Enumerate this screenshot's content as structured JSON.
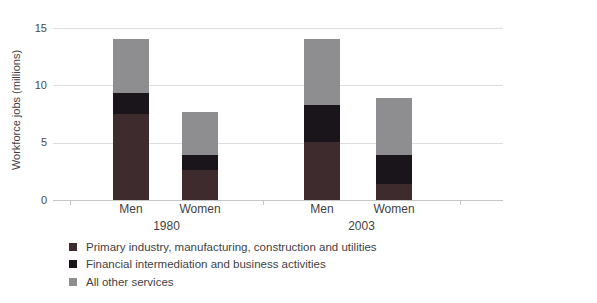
{
  "chart_data": {
    "type": "bar",
    "stacked": true,
    "title": "",
    "ylabel": "Workforce jobs (millions)",
    "ylim": [
      0,
      15
    ],
    "yticks": [
      0,
      5,
      10,
      15
    ],
    "grid": true,
    "legend_position": "bottom-left",
    "groups": [
      "1980",
      "2003"
    ],
    "categories": [
      "Men",
      "Women",
      "Men",
      "Women"
    ],
    "series": [
      {
        "name": "Primary industry, manufacturing, construction and utilities",
        "color": "#3e2b2e",
        "values": [
          7.5,
          2.6,
          5.1,
          1.4
        ]
      },
      {
        "name": "Financial intermediation and business activities",
        "color": "#1a151a",
        "values": [
          1.8,
          1.3,
          3.2,
          2.5
        ]
      },
      {
        "name": "All other services",
        "color": "#8e8d90",
        "values": [
          4.7,
          3.8,
          5.7,
          5.0
        ]
      }
    ],
    "totals": [
      14.0,
      7.7,
      14.0,
      8.9
    ],
    "grid_color": "#dedede",
    "axis_color": "#c6c6c6",
    "text_color": "#3f3f3f"
  }
}
